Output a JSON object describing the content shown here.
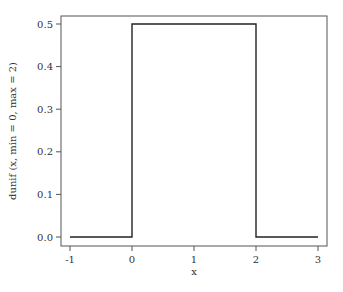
{
  "chart_data": {
    "type": "line",
    "title": "",
    "xlabel": "x",
    "ylabel": "dunif (x, min = 0, max = 2)",
    "xlim": [
      -1,
      3
    ],
    "ylim": [
      0,
      0.5
    ],
    "x_ticks": [
      -1,
      0,
      1,
      2,
      3
    ],
    "x_tick_labels": [
      "-1",
      "0",
      "1",
      "2",
      "3"
    ],
    "y_ticks": [
      0.0,
      0.1,
      0.2,
      0.3,
      0.4,
      0.5
    ],
    "y_tick_labels": [
      "0.0",
      "0.1",
      "0.2",
      "0.3",
      "0.4",
      "0.5"
    ],
    "grid": false,
    "legend": null,
    "series": [
      {
        "name": "dunif(x, min = 0, max = 2)",
        "x": [
          -1,
          0,
          0,
          2,
          2,
          3
        ],
        "y": [
          0,
          0,
          0.5,
          0.5,
          0,
          0
        ],
        "color": "#222222"
      }
    ]
  }
}
